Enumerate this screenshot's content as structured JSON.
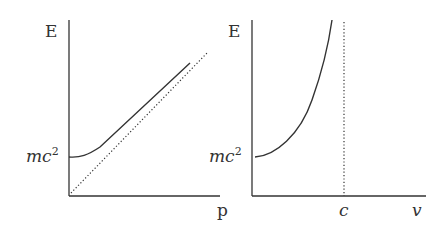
{
  "panels": [
    {
      "id": "energy-momentum",
      "y_label": "E",
      "x_label": "p",
      "intercept_label_base": "mc",
      "intercept_label_exp": "2",
      "curves": [
        "E = sqrt(p^2c^2 + m^2c^4)",
        "asymptote E = pc (dotted)"
      ]
    },
    {
      "id": "energy-velocity",
      "y_label": "E",
      "x_label": "v",
      "intercept_label_base": "mc",
      "intercept_label_exp": "2",
      "asymptote_label": "c",
      "curves": [
        "E = gamma m c^2",
        "vertical asymptote v = c (dotted)"
      ]
    }
  ],
  "colors": {
    "line": "#333333",
    "background": "#ffffff"
  }
}
